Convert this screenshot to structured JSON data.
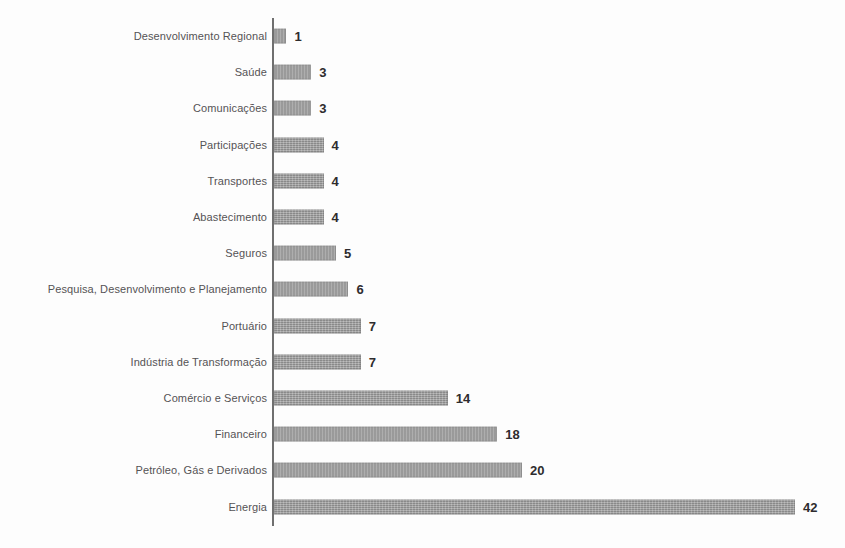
{
  "chart_data": {
    "type": "bar",
    "orientation": "horizontal",
    "title": "",
    "subtitle": "",
    "xlabel": "",
    "ylabel": "",
    "xlim": [
      0,
      42
    ],
    "grid": false,
    "legend": false,
    "bar_color": "#9a9a9a",
    "axis_color": "#6f6f6f",
    "label_color": "#555355",
    "value_color": "#2e2c2e",
    "categories": [
      "Desenvolvimento Regional",
      "Saúde",
      "Comunicações",
      "Participações",
      "Transportes",
      "Abastecimento",
      "Seguros",
      "Pesquisa, Desenvolvimento e Planejamento",
      "Portuário",
      "Indústria de Transformação",
      "Comércio e Serviços",
      "Financeiro",
      "Petróleo, Gás e Derivados",
      "Energia"
    ],
    "values": [
      1,
      3,
      3,
      4,
      4,
      4,
      5,
      6,
      7,
      7,
      14,
      18,
      20,
      42
    ],
    "value_labels": [
      "1",
      "3",
      "3",
      "4",
      "4",
      "4",
      "5",
      "6",
      "7",
      "7",
      "14",
      "18",
      "20",
      "42"
    ]
  }
}
